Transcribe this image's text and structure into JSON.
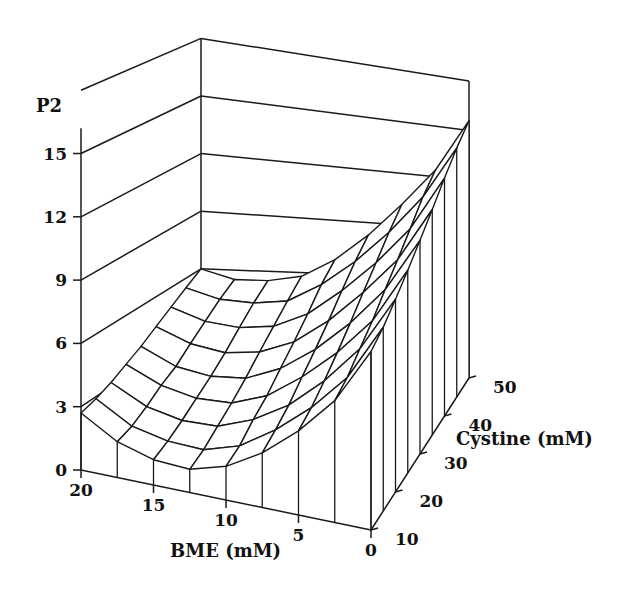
{
  "chart_data": {
    "type": "surface3d",
    "title": "",
    "zlabel": "P2",
    "xlabel": "BME (mM)",
    "ylabel": "Cystine (mM)",
    "x_axis": {
      "label": "BME (mM)",
      "range": [
        20,
        0
      ],
      "ticks": [
        20,
        15,
        10,
        5,
        0
      ],
      "tick_labels": [
        "20",
        "15",
        "10",
        "5",
        "0"
      ]
    },
    "y_axis": {
      "label": "Cystine (mM)",
      "range": [
        10,
        50
      ],
      "ticks": [
        10,
        20,
        30,
        40,
        50
      ],
      "tick_labels": [
        "10",
        "20",
        "30",
        "40",
        "50"
      ]
    },
    "z_axis": {
      "label": "P2",
      "range": [
        0,
        18
      ],
      "ticks": [
        0,
        3,
        6,
        9,
        12,
        15
      ],
      "tick_labels": [
        "0",
        "3",
        "6",
        "9",
        "12",
        "15"
      ]
    },
    "grid": true,
    "legend": "none",
    "grid_x_bme": [
      20,
      17.5,
      15,
      12.5,
      10,
      7.5,
      5,
      2.5,
      0
    ],
    "grid_y_cystine": [
      10,
      15,
      20,
      25,
      30,
      35,
      40,
      45,
      50
    ],
    "z_values": [
      [
        2.7,
        1.7,
        1.2,
        1.1,
        1.6,
        2.6,
        4.0,
        5.8,
        8.5
      ],
      [
        2.9,
        1.9,
        1.5,
        1.4,
        1.9,
        3.0,
        4.4,
        6.2,
        9.0
      ],
      [
        3.2,
        2.3,
        1.9,
        1.9,
        2.5,
        3.5,
        5.0,
        6.9,
        9.7
      ],
      [
        3.6,
        2.8,
        2.4,
        2.4,
        3.0,
        4.2,
        5.7,
        7.6,
        10.5
      ],
      [
        4.0,
        3.2,
        2.9,
        3.0,
        3.7,
        4.9,
        6.5,
        8.5,
        11.4
      ],
      [
        4.5,
        3.8,
        3.5,
        3.7,
        4.4,
        5.7,
        7.4,
        9.4,
        12.4
      ],
      [
        5.0,
        4.4,
        4.2,
        4.4,
        5.2,
        6.6,
        8.3,
        10.4,
        13.5
      ],
      [
        5.5,
        5.0,
        4.9,
        5.1,
        6.1,
        7.5,
        9.3,
        11.5,
        14.6
      ],
      [
        6.0,
        5.5,
        5.5,
        5.8,
        6.8,
        8.3,
        10.2,
        12.4,
        15.6
      ]
    ]
  }
}
